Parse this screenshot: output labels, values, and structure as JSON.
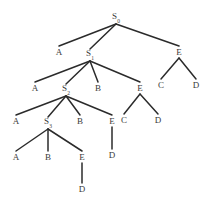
{
  "figure": {
    "title": "",
    "type": "parse-tree-diagram",
    "background_color": "#ffffff",
    "edge_color": "#2b2b2b",
    "label_color": "#3a3a3a",
    "width": 211,
    "height": 203
  },
  "chart_data": {
    "type": "tree",
    "title": "",
    "nodes": [
      {
        "id": "S0",
        "base": "S",
        "subscript": "0",
        "x": 116,
        "y": 18,
        "level": 0
      },
      {
        "id": "A1",
        "base": "A",
        "subscript": "",
        "x": 59,
        "y": 52,
        "level": 1
      },
      {
        "id": "S1",
        "base": "S",
        "subscript": "1",
        "x": 90,
        "y": 55,
        "level": 1
      },
      {
        "id": "E1",
        "base": "E",
        "subscript": "",
        "x": 179,
        "y": 52,
        "level": 1
      },
      {
        "id": "E1C",
        "base": "C",
        "subscript": "",
        "x": 161,
        "y": 85,
        "level": 2
      },
      {
        "id": "E1D",
        "base": "D",
        "subscript": "",
        "x": 196,
        "y": 85,
        "level": 2
      },
      {
        "id": "A2",
        "base": "A",
        "subscript": "",
        "x": 35,
        "y": 88,
        "level": 2
      },
      {
        "id": "S2",
        "base": "S",
        "subscript": "2",
        "x": 66,
        "y": 90,
        "level": 2
      },
      {
        "id": "B2",
        "base": "B",
        "subscript": "",
        "x": 98,
        "y": 88,
        "level": 2
      },
      {
        "id": "E2",
        "base": "E",
        "subscript": "",
        "x": 140,
        "y": 88,
        "level": 2
      },
      {
        "id": "E2C",
        "base": "C",
        "subscript": "",
        "x": 124,
        "y": 120,
        "level": 3
      },
      {
        "id": "E2D",
        "base": "D",
        "subscript": "",
        "x": 158,
        "y": 120,
        "level": 3
      },
      {
        "id": "A3",
        "base": "A",
        "subscript": "",
        "x": 16,
        "y": 121,
        "level": 3
      },
      {
        "id": "S3",
        "base": "S",
        "subscript": "3",
        "x": 48,
        "y": 123,
        "level": 3
      },
      {
        "id": "B3",
        "base": "B",
        "subscript": "",
        "x": 80,
        "y": 121,
        "level": 3
      },
      {
        "id": "E3",
        "base": "E",
        "subscript": "",
        "x": 112,
        "y": 121,
        "level": 3
      },
      {
        "id": "E3D",
        "base": "D",
        "subscript": "",
        "x": 112,
        "y": 155,
        "level": 4
      },
      {
        "id": "A4",
        "base": "A",
        "subscript": "",
        "x": 16,
        "y": 157,
        "level": 4
      },
      {
        "id": "B4",
        "base": "B",
        "subscript": "",
        "x": 48,
        "y": 157,
        "level": 4
      },
      {
        "id": "E4",
        "base": "E",
        "subscript": "",
        "x": 82,
        "y": 157,
        "level": 4
      },
      {
        "id": "E4D",
        "base": "D",
        "subscript": "",
        "x": 82,
        "y": 189,
        "level": 5
      }
    ],
    "edges": [
      {
        "from": "S0",
        "to": "A1"
      },
      {
        "from": "S0",
        "to": "S1"
      },
      {
        "from": "S0",
        "to": "E1"
      },
      {
        "from": "E1",
        "to": "E1C"
      },
      {
        "from": "E1",
        "to": "E1D"
      },
      {
        "from": "S1",
        "to": "A2"
      },
      {
        "from": "S1",
        "to": "S2"
      },
      {
        "from": "S1",
        "to": "B2"
      },
      {
        "from": "S1",
        "to": "E2"
      },
      {
        "from": "E2",
        "to": "E2C"
      },
      {
        "from": "E2",
        "to": "E2D"
      },
      {
        "from": "S2",
        "to": "A3"
      },
      {
        "from": "S2",
        "to": "S3"
      },
      {
        "from": "S2",
        "to": "B3"
      },
      {
        "from": "S2",
        "to": "E3"
      },
      {
        "from": "E3",
        "to": "E3D"
      },
      {
        "from": "S3",
        "to": "A4"
      },
      {
        "from": "S3",
        "to": "B4"
      },
      {
        "from": "S3",
        "to": "E4"
      },
      {
        "from": "E4",
        "to": "E4D"
      }
    ]
  }
}
